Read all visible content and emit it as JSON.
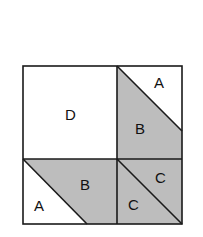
{
  "diagram": {
    "type": "quilt-block",
    "colors": {
      "shaded": "#bdbdbd",
      "background": "#ffffff",
      "line": "#1a1a1a"
    },
    "labels": {
      "d": "D",
      "a_top_right": "A",
      "b_top_right": "B",
      "b_bottom_left": "B",
      "a_bottom_left": "A",
      "c_upper": "C",
      "c_lower": "C"
    }
  }
}
